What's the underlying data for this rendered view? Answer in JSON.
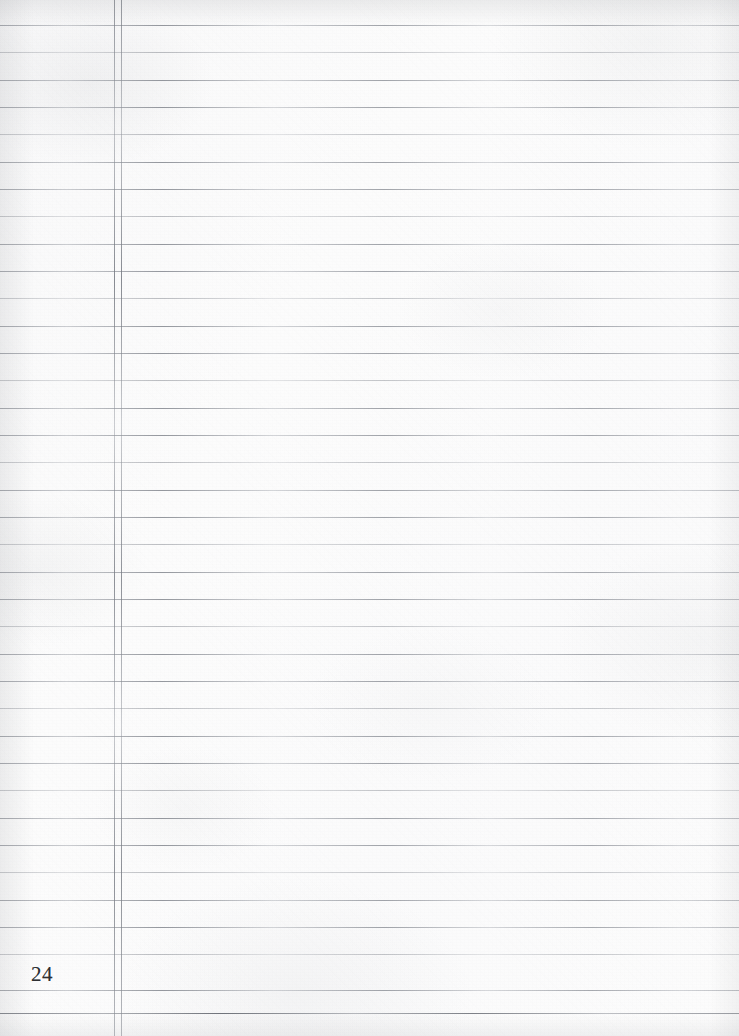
{
  "page": {
    "kind": "lined-notebook-paper",
    "width": 739,
    "height": 1036,
    "page_number": "24",
    "paper_color": "#fcfcfc",
    "rule_color": "#808490",
    "margin_rule_color": "#787c84",
    "page_number_color": "#2e3033"
  },
  "margin": {
    "style": "double-vertical-rule",
    "x_positions": [
      114,
      121
    ]
  },
  "ruling": {
    "first_line_y": 25,
    "line_spacing": 27.3,
    "line_count": 37,
    "lines_y": [
      25,
      52,
      80,
      107,
      134,
      162,
      189,
      216,
      244,
      271,
      298,
      326,
      353,
      380,
      408,
      435,
      462,
      490,
      517,
      544,
      572,
      599,
      626,
      654,
      681,
      708,
      736,
      763,
      790,
      818,
      845,
      872,
      900,
      927,
      954,
      990,
      1013
    ],
    "strong_lines_y": [
      1013
    ]
  },
  "content": {
    "body_text": "",
    "note": "blank ruled page"
  }
}
